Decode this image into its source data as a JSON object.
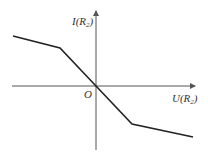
{
  "diagram": {
    "title": "",
    "y_axis_label": {
      "prefix": "I(R",
      "sub": "2",
      "suffix": ")"
    },
    "x_axis_label": {
      "prefix": "U(R",
      "sub": "2",
      "suffix": ")"
    },
    "origin_label": "O",
    "colors": {
      "axis": "#555555",
      "curve": "#222222"
    },
    "curve_points": [
      [
        13,
        36
      ],
      [
        60,
        48
      ],
      [
        96,
        86
      ],
      [
        132,
        124
      ],
      [
        193,
        137
      ]
    ]
  }
}
